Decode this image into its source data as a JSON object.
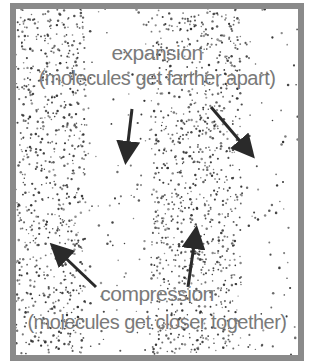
{
  "diagram": {
    "expansion": {
      "title": "expansion",
      "subtitle": "(molecules get farther apart)"
    },
    "compression": {
      "title": "compression",
      "subtitle": "(molecules get closer together)"
    },
    "colors": {
      "frame": "#8a8a8a",
      "text": "#7a7a7a",
      "dots": "#333333",
      "arrows": "#2a2a2a"
    },
    "regions": [
      {
        "type": "compression",
        "x_from": 0,
        "x_to": 70
      },
      {
        "type": "expansion",
        "x_from": 70,
        "x_to": 135
      },
      {
        "type": "compression",
        "x_from": 135,
        "x_to": 225
      },
      {
        "type": "expansion",
        "x_from": 225,
        "x_to": 282
      }
    ]
  }
}
